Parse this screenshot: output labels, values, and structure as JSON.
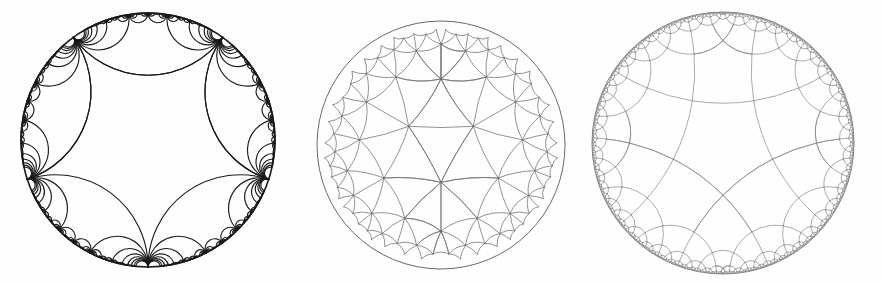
{
  "plate": {
    "title": "Three hyperbolic tessellations of the Poincare disk",
    "caption": "",
    "background_color": "#fefefe",
    "width": 883,
    "height": 284
  },
  "figures": [
    {
      "id": "figure-a",
      "label": "",
      "model": "Poincare disk",
      "tessellation": "ideal triangulation",
      "schlafli": "{3, infinity}",
      "cusp_count": 5,
      "center_x": 148,
      "center_y": 140,
      "radius": 127,
      "boundary_color": "#1a1a1a",
      "geodesic_color": "#1a1a1a",
      "stroke_width": 1.15,
      "boundary_stroke_width": 1.6,
      "depth": 7,
      "seed_vertices_deg": [
        90,
        162,
        234,
        306,
        18
      ],
      "style": "dark"
    },
    {
      "id": "figure-b",
      "label": "",
      "model": "Poincare disk",
      "tessellation": "triangular tiling",
      "schlafli": "{3, 7}",
      "p": 3,
      "q": 7,
      "center_x": 441,
      "center_y": 145,
      "radius": 124,
      "boundary_color": "#6a6a6a",
      "geodesic_color": "#6f6f6f",
      "stroke_width": 0.75,
      "boundary_stroke_width": 1.0,
      "depth": 6,
      "style": "medium"
    },
    {
      "id": "figure-c",
      "label": "",
      "model": "Poincare disk",
      "tessellation": "right-angled pentagonal tiling",
      "schlafli": "{5, 4}",
      "p": 5,
      "q": 4,
      "center_x": 723,
      "center_y": 143,
      "radius": 131,
      "boundary_color": "#808080",
      "geodesic_color": "#8a8a8a",
      "stroke_width": 0.72,
      "boundary_stroke_width": 1.0,
      "depth": 6,
      "style": "light"
    }
  ]
}
